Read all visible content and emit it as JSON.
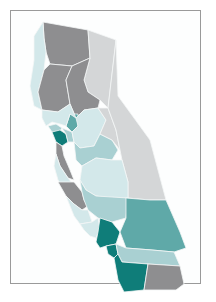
{
  "map": {
    "title": "",
    "subject": "California counties choropleth",
    "palette": {
      "dark_gray": "#8e8e90",
      "light_gray": "#d4d6d7",
      "pale_teal": "#d3e8ea",
      "light_teal": "#a9d0d2",
      "mid_teal": "#5fa9a8",
      "dark_teal": "#0f7d79"
    },
    "regions": [
      {
        "name": "north-interior",
        "class": "dark_gray"
      },
      {
        "name": "northeast",
        "class": "light_gray"
      },
      {
        "name": "north-coast",
        "class": "pale_teal"
      },
      {
        "name": "sacramento-valley",
        "class": "dark_gray"
      },
      {
        "name": "sierra-north",
        "class": "dark_gray"
      },
      {
        "name": "sacramento-county",
        "class": "mid_teal"
      },
      {
        "name": "north-bay",
        "class": "pale_teal"
      },
      {
        "name": "marin",
        "class": "light_teal"
      },
      {
        "name": "bay-east",
        "class": "dark_teal"
      },
      {
        "name": "bay-south",
        "class": "light_teal"
      },
      {
        "name": "san-mateo",
        "class": "dark_gray"
      },
      {
        "name": "central-valley-north",
        "class": "pale_teal"
      },
      {
        "name": "central-valley-mid",
        "class": "light_teal"
      },
      {
        "name": "sierra-central",
        "class": "light_gray"
      },
      {
        "name": "eastern-sierra",
        "class": "light_gray"
      },
      {
        "name": "central-coast-north",
        "class": "pale_teal"
      },
      {
        "name": "monterey",
        "class": "dark_gray"
      },
      {
        "name": "fresno-valley",
        "class": "pale_teal"
      },
      {
        "name": "tulare-kern",
        "class": "light_teal"
      },
      {
        "name": "san-luis-obispo",
        "class": "pale_teal"
      },
      {
        "name": "santa-barbara",
        "class": "pale_teal"
      },
      {
        "name": "los-angeles",
        "class": "dark_teal"
      },
      {
        "name": "san-bernardino",
        "class": "mid_teal"
      },
      {
        "name": "orange",
        "class": "dark_teal"
      },
      {
        "name": "riverside",
        "class": "light_teal"
      },
      {
        "name": "san-diego",
        "class": "dark_teal"
      },
      {
        "name": "imperial",
        "class": "dark_gray"
      }
    ]
  }
}
